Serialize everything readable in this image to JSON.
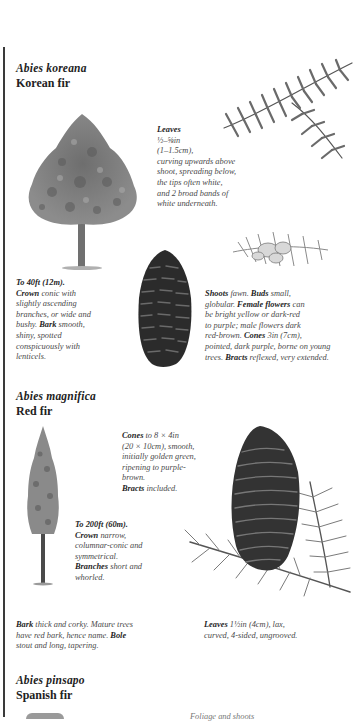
{
  "species": [
    {
      "latin_name": "Abies koreana",
      "common_name": "Korean fir",
      "leaves": {
        "label": "Leaves",
        "size": "½–⅝in",
        "metric": "(1–1.5cm),",
        "lines": [
          "curving upwards above",
          "shoot, spreading below,",
          "the tips often white,",
          "and 2 broad bands of",
          "white underneath."
        ]
      },
      "height": {
        "label": "To 40ft (12m).",
        "crown_label": "Crown",
        "crown_lines": [
          "conic with",
          "slightly ascending",
          "branches, or wide and",
          "bushy."
        ],
        "bark_label": "Bark",
        "bark_lines": [
          "smooth,",
          "shiny, spotted",
          "conspicuously with",
          "lenticels."
        ]
      },
      "shoots": {
        "shoots_label": "Shoots",
        "shoots_text": "fawn.",
        "buds_label": "Buds",
        "buds_text": "small,",
        "line2a": "globular.",
        "female_label": "Female flowers",
        "female_text": "can",
        "line3": "be bright yellow or dark-red",
        "line4": "to purple; male flowers dark",
        "line5a": "red-brown.",
        "cones_label": "Cones",
        "cones_text": "3in (7cm),",
        "line6": "pointed, dark purple, borne on young",
        "line7a": "trees.",
        "bracts_label": "Bracts",
        "bracts_text": "reflexed, very extended."
      },
      "illustrations": [
        "tree-icon",
        "branch-icon",
        "cone-icon",
        "flower-sprig-icon"
      ]
    },
    {
      "latin_name": "Abies magnifica",
      "common_name": "Red fir",
      "cones": {
        "label": "Cones",
        "text1": "to 8 × 4in",
        "lines": [
          "(20 × 10cm), smooth,",
          "initially golden green,",
          "ripening to purple-",
          "brown."
        ],
        "bracts_label": "Bracts",
        "bracts_text": "included."
      },
      "height": {
        "label": "To 200ft (60m).",
        "crown_label": "Crown",
        "crown_text": "narrow,",
        "lines": [
          "columnar-conic and",
          "symmetrical."
        ],
        "branches_label": "Branches",
        "branches_text": "short and",
        "branches_line2": "whorled."
      },
      "bark": {
        "label": "Bark",
        "text1": "thick and corky. Mature trees",
        "line2a": "have red bark, hence name.",
        "bole_label": "Bole",
        "line3": "stout and long, tapering."
      },
      "leaves": {
        "label": "Leaves",
        "text1": "1½in (4cm), lax,",
        "line2": "curved, 4-sided, ungrooved."
      },
      "illustrations": [
        "tall-tree-icon",
        "cone-on-branch-icon"
      ]
    },
    {
      "latin_name": "Abies pinsapo",
      "common_name": "Spanish fir",
      "partial_text": "Foliage and shoots"
    }
  ]
}
